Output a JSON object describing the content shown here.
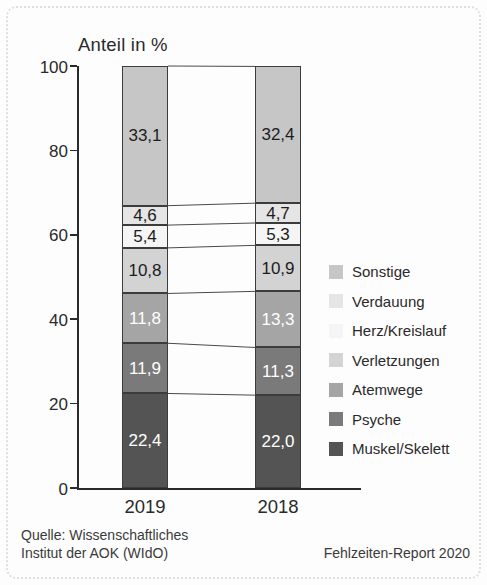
{
  "figure": {
    "footer": {
      "source_line1": "Quelle: Wissenschaftliches",
      "source_line2": "Institut der AOK (WIdO)",
      "report_label": "Fehlzeiten-Report 2020"
    }
  },
  "chart_data": {
    "type": "bar",
    "stacked": true,
    "title": "Anteil in %",
    "ylabel": "Anteil in %",
    "xlabel": "",
    "ylim": [
      0,
      100
    ],
    "yticks": [
      0,
      20,
      40,
      60,
      80,
      100
    ],
    "grid": false,
    "legend_position": "right",
    "categories": [
      "2019",
      "2018"
    ],
    "decimal_separator": ",",
    "connector_lines": true,
    "series": [
      {
        "name": "Sonstige",
        "color": "#c6c6c6",
        "text_color": "#1c1c1c",
        "pattern": "none",
        "values": [
          33.1,
          32.4
        ]
      },
      {
        "name": "Verdauung",
        "color": "#e5e5e5",
        "text_color": "#1c1c1c",
        "pattern": "dots",
        "values": [
          4.6,
          4.7
        ]
      },
      {
        "name": "Herz/Kreislauf",
        "color": "#f5f5f5",
        "text_color": "#1c1c1c",
        "pattern": "none",
        "values": [
          5.4,
          5.3
        ]
      },
      {
        "name": "Verletzungen",
        "color": "#d3d3d3",
        "text_color": "#1c1c1c",
        "pattern": "dots",
        "values": [
          10.8,
          10.9
        ]
      },
      {
        "name": "Atemwege",
        "color": "#a5a5a5",
        "text_color": "#ffffff",
        "pattern": "none",
        "values": [
          11.8,
          13.3
        ]
      },
      {
        "name": "Psyche",
        "color": "#7a7a7a",
        "text_color": "#ffffff",
        "pattern": "none",
        "values": [
          11.9,
          11.3
        ]
      },
      {
        "name": "Muskel/Skelett",
        "color": "#545454",
        "text_color": "#ffffff",
        "pattern": "none",
        "values": [
          22.4,
          22.0
        ]
      }
    ]
  }
}
